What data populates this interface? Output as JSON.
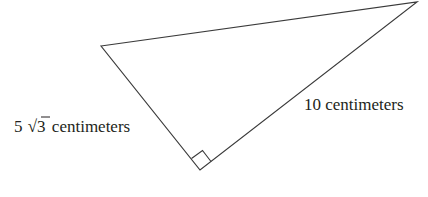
{
  "figure": {
    "type": "right-triangle",
    "stroke_color": "#3a3a3a",
    "label_color": "#231f20",
    "vertices": {
      "top_left": [
        101,
        46
      ],
      "top_right": [
        417,
        2
      ],
      "bottom_right_angle": [
        200,
        170
      ]
    },
    "labels": {
      "left_leg_coefficient": "5",
      "left_leg_radicand": "3",
      "left_leg_unit": "centimeters",
      "right_leg": "10 centimeters"
    },
    "right_angle_marker": "at bottom vertex"
  }
}
